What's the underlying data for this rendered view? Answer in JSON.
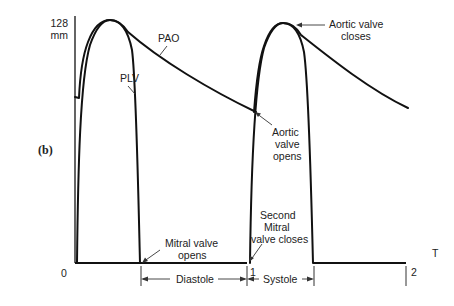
{
  "figure": {
    "panel_label": "(b)",
    "y_axis": {
      "max_label": "128",
      "unit_label": "mm"
    },
    "x_axis": {
      "label": "T",
      "ticks": [
        "0",
        "1",
        "2"
      ]
    },
    "curves": [
      {
        "name": "PAO",
        "label": "PAO"
      },
      {
        "name": "PLV",
        "label": "PLV"
      }
    ],
    "annotations": {
      "aortic_valve_closes": [
        "Aortic valve",
        "closes"
      ],
      "aortic_valve_opens": [
        "Aortic",
        "valve",
        "opens"
      ],
      "mitral_valve_opens": [
        "Mitral valve",
        "opens"
      ],
      "second_mitral_valve_closes": [
        "Second",
        "Mitral",
        "valve closes"
      ]
    },
    "phases": [
      {
        "name": "diastole",
        "label": "Diastole"
      },
      {
        "name": "systole",
        "label": "Systole"
      }
    ],
    "colors": {
      "line": "#111111",
      "text": "#222222",
      "background": "#ffffff"
    }
  }
}
